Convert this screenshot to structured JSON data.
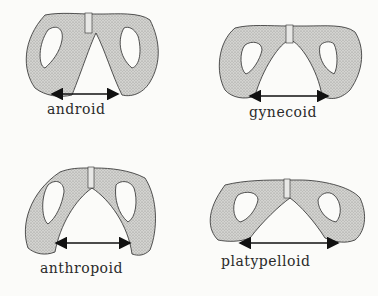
{
  "diagram": {
    "panels": [
      {
        "id": "android",
        "label": "android",
        "inlet_shape": "triangular (heart-shaped)"
      },
      {
        "id": "gynecoid",
        "label": "gynecoid",
        "inlet_shape": "rounded"
      },
      {
        "id": "anthropoid",
        "label": "anthropoid",
        "inlet_shape": "tall oval"
      },
      {
        "id": "platypelloid",
        "label": "platypelloid",
        "inlet_shape": "flat wide oval"
      }
    ],
    "colors": {
      "bone_fill": "#c9c9c6",
      "stipple": "#8e8e8b",
      "outline": "#2b2b2b",
      "background": "#fbfbf9",
      "arrow": "#111111"
    }
  }
}
